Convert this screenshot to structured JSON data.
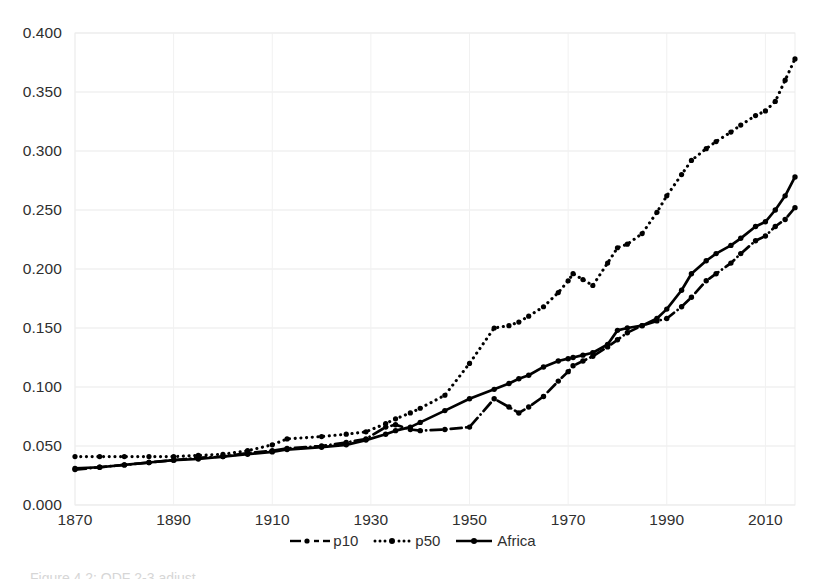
{
  "chart_data": {
    "type": "line",
    "title": "",
    "subtitle": "",
    "xlabel": "",
    "ylabel": "",
    "xlim": [
      1870,
      2016
    ],
    "ylim": [
      0.0,
      0.4
    ],
    "grid": true,
    "grid_axis": "y",
    "legend_position": "bottom-center",
    "x_ticks": [
      1870,
      1890,
      1910,
      1930,
      1950,
      1970,
      1990,
      2010
    ],
    "x_tick_labels": [
      "1870",
      "1890",
      "1910",
      "1930",
      "1950",
      "1970",
      "1990",
      "2010"
    ],
    "y_ticks": [
      0.0,
      0.05,
      0.1,
      0.15,
      0.2,
      0.25,
      0.3,
      0.35,
      0.4
    ],
    "y_tick_labels": [
      "0.000",
      "0.050",
      "0.100",
      "0.150",
      "0.200",
      "0.250",
      "0.300",
      "0.350",
      "0.400"
    ],
    "x": [
      1870,
      1875,
      1880,
      1885,
      1890,
      1895,
      1900,
      1905,
      1910,
      1913,
      1920,
      1925,
      1929,
      1933,
      1935,
      1938,
      1940,
      1945,
      1950,
      1955,
      1958,
      1960,
      1962,
      1965,
      1968,
      1970,
      1971,
      1973,
      1975,
      1978,
      1980,
      1982,
      1985,
      1988,
      1990,
      1993,
      1995,
      1998,
      2000,
      2003,
      2005,
      2008,
      2010,
      2012,
      2014,
      2016
    ],
    "series": [
      {
        "name": "p10",
        "style": "dash-dot",
        "marker": "circle",
        "color": "#000000",
        "values": [
          0.03,
          0.032,
          0.034,
          0.036,
          0.038,
          0.04,
          0.041,
          0.044,
          0.046,
          0.048,
          0.05,
          0.053,
          0.056,
          0.066,
          0.068,
          0.064,
          0.063,
          0.064,
          0.066,
          0.09,
          0.083,
          0.078,
          0.083,
          0.092,
          0.105,
          0.113,
          0.118,
          0.122,
          0.126,
          0.134,
          0.14,
          0.146,
          0.152,
          0.156,
          0.158,
          0.168,
          0.176,
          0.19,
          0.196,
          0.205,
          0.213,
          0.224,
          0.228,
          0.236,
          0.242,
          0.252
        ]
      },
      {
        "name": "p50",
        "style": "dotted",
        "marker": "circle",
        "color": "#000000",
        "values": [
          0.041,
          0.041,
          0.041,
          0.041,
          0.041,
          0.042,
          0.043,
          0.046,
          0.051,
          0.056,
          0.058,
          0.06,
          0.062,
          0.069,
          0.073,
          0.078,
          0.082,
          0.093,
          0.12,
          0.15,
          0.152,
          0.155,
          0.16,
          0.168,
          0.18,
          0.19,
          0.196,
          0.191,
          0.186,
          0.205,
          0.218,
          0.221,
          0.23,
          0.248,
          0.262,
          0.28,
          0.292,
          0.302,
          0.308,
          0.316,
          0.322,
          0.33,
          0.334,
          0.342,
          0.36,
          0.378
        ]
      },
      {
        "name": "Africa",
        "style": "solid",
        "marker": "circle",
        "color": "#000000",
        "values": [
          0.031,
          0.032,
          0.034,
          0.036,
          0.038,
          0.039,
          0.041,
          0.043,
          0.045,
          0.047,
          0.049,
          0.051,
          0.055,
          0.06,
          0.063,
          0.066,
          0.07,
          0.08,
          0.09,
          0.098,
          0.103,
          0.107,
          0.11,
          0.117,
          0.122,
          0.124,
          0.125,
          0.127,
          0.129,
          0.136,
          0.148,
          0.15,
          0.152,
          0.158,
          0.166,
          0.182,
          0.196,
          0.207,
          0.213,
          0.22,
          0.226,
          0.236,
          0.24,
          0.25,
          0.262,
          0.278
        ]
      }
    ]
  },
  "legend": {
    "items": [
      {
        "label": "p10",
        "sample": "dash-dot-marker"
      },
      {
        "label": "p50",
        "sample": "dotted-marker"
      },
      {
        "label": "Africa",
        "sample": "solid-marker"
      }
    ]
  },
  "caption": {
    "text": "Figure 4.2: ODF 2-3 adjust"
  },
  "colors": {
    "series": "#000000",
    "grid": "#e9e9e9",
    "axis_text": "#2f2f2f",
    "background": "#ffffff"
  }
}
